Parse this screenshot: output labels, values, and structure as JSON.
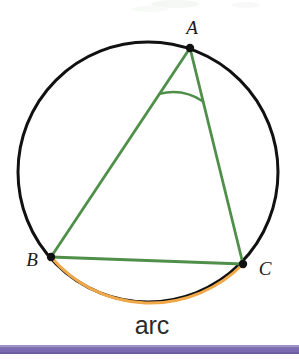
{
  "figure": {
    "background_color": "#ffffff",
    "width": 299,
    "height": 359
  },
  "labels": {
    "vertex_a": "A",
    "vertex_b": "B",
    "vertex_c": "C",
    "arc_caption": "arc"
  },
  "colors": {
    "circle_stroke": "#111111",
    "chord_stroke": "#4f8f4a",
    "angle_arc_stroke": "#4f8f4a",
    "highlight_arc_stroke": "#f0a848",
    "vertex_dot_fill": "#111111",
    "label_text": "#1a1a1a",
    "caption_text": "#2b2b2b",
    "footer_bar": "#7c6bb0",
    "footer_bar_light": "#9e92c6"
  },
  "geometry": {
    "circle": {
      "cx": 148,
      "cy": 172,
      "r": 130,
      "stroke_width": 3
    },
    "points": {
      "A": {
        "x": 190,
        "y": 48
      },
      "B": {
        "x": 51,
        "y": 257
      },
      "C": {
        "x": 243,
        "y": 264
      }
    },
    "chords": [
      {
        "name": "AB",
        "from": "A",
        "to": "B"
      },
      {
        "name": "AC",
        "from": "A",
        "to": "C"
      },
      {
        "name": "BC",
        "from": "B",
        "to": "C"
      }
    ],
    "angle_marker": {
      "vertex": "A",
      "radius": 55,
      "stroke_width": 2.4
    },
    "highlighted_arc": {
      "from": "B",
      "to": "C",
      "side": "minor-bottom",
      "stroke_width": 3
    },
    "label_positions": {
      "A": {
        "x": 192,
        "y": 34,
        "anchor": "middle"
      },
      "B": {
        "x": 32,
        "y": 266,
        "anchor": "middle"
      },
      "C": {
        "x": 265,
        "y": 275,
        "anchor": "middle"
      },
      "arc_caption": {
        "x": 152,
        "y": 334,
        "anchor": "middle"
      }
    },
    "footer_bar": {
      "x": 0,
      "y": 345,
      "width": 299,
      "height": 9
    }
  }
}
